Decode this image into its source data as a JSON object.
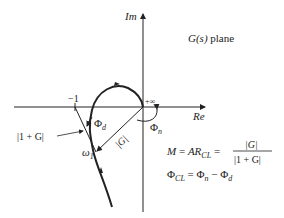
{
  "axes": {
    "im_label": "Im",
    "re_label": "Re"
  },
  "plane_label_fn": "G(s)",
  "plane_label_word": "plane",
  "minus_one": "−1",
  "plus_inf": "+∞",
  "one_plus_g": "|1 + G|",
  "abs_g": "|G|",
  "phi_d": "Φd",
  "phi_n": "Φn",
  "omega1": "ω1",
  "eq1_left": "M = AR",
  "eq1_sub": "CL",
  "eq1_num": "|G|",
  "eq1_den": "|1 + G|",
  "eq2": "Φ",
  "eq2_sub": "CL",
  "eq2_rhs": "= Φn − Φd"
}
